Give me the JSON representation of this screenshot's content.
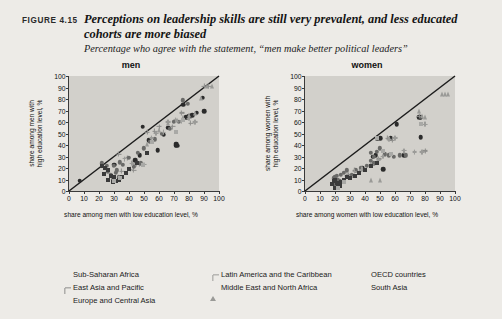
{
  "figure": {
    "number": "FIGURE 4.15",
    "title": "Perceptions on leadership skills are still very prevalent, and less educated cohorts are more biased",
    "subtitle": "Percentage who agree with the statement, “men make better political leaders”"
  },
  "legend": {
    "columns": [
      [
        {
          "label": "Sub-Saharan Africa",
          "marker": "circle",
          "color": "#2b2b2b",
          "size": 5.4
        },
        {
          "label": "East Asia and Pacific",
          "marker": "plus",
          "color": "#8d8d8a",
          "size": 6.4
        },
        {
          "label": "Europe and Central Asia",
          "marker": "circle",
          "color": "#6a6a68",
          "size": 5.4
        }
      ],
      [
        {
          "label": "Latin America and the Caribbean",
          "marker": "plus",
          "color": "#9b9b98",
          "size": 6.0
        },
        {
          "label": "Middle East and North Africa",
          "marker": "triangle",
          "color": "#9a9a97",
          "size": 5.6
        }
      ],
      [
        {
          "label": "OECD countries",
          "marker": "square",
          "color": "#3a3a3a",
          "size": 5.2
        },
        {
          "label": "South Asia",
          "marker": "square",
          "color": "#a9a9a6",
          "size": 5.2
        }
      ]
    ]
  },
  "chart_data": [
    {
      "type": "scatter",
      "title": "men",
      "xlabel": "share among men with low education level, %",
      "ylabel": "share among men with\nhigh education level, %",
      "xlim": [
        0,
        100
      ],
      "ylim": [
        0,
        100
      ],
      "xticks": [
        0,
        10,
        20,
        30,
        40,
        50,
        60,
        70,
        80,
        90,
        100
      ],
      "yticks": [
        0,
        10,
        20,
        30,
        40,
        50,
        60,
        70,
        80,
        90,
        100
      ],
      "grid": false,
      "reference_line": {
        "type": "45-degree",
        "from": [
          0,
          0
        ],
        "to": [
          100,
          100
        ]
      },
      "series": [
        {
          "name": "Sub-Saharan Africa",
          "marker": "circle",
          "color": "#2b2b2b",
          "size": 4.6,
          "points": [
            [
              7,
              9
            ],
            [
              30,
              23
            ],
            [
              44,
              27
            ],
            [
              49,
              56
            ],
            [
              59,
              35.5
            ],
            [
              63,
              49
            ],
            [
              71,
              40
            ],
            [
              71.5,
              41
            ],
            [
              72,
              39.5
            ],
            [
              76,
              75
            ],
            [
              78,
              64
            ],
            [
              80,
              65
            ],
            [
              82,
              66
            ],
            [
              85,
              68
            ],
            [
              90,
              69.5
            ],
            [
              89,
              81
            ],
            [
              47,
              31
            ],
            [
              53,
              44
            ],
            [
              66,
              55
            ]
          ]
        },
        {
          "name": "East Asia and Pacific",
          "marker": "plus",
          "color": "#8d8d8a",
          "size": 5.0,
          "points": [
            [
              33,
              32
            ],
            [
              39,
              29
            ],
            [
              44,
              23
            ],
            [
              47,
              23.5
            ],
            [
              52,
              51
            ],
            [
              57,
              52
            ],
            [
              60,
              56
            ],
            [
              69,
              56
            ],
            [
              75,
              68
            ],
            [
              81,
              59
            ],
            [
              90,
              91
            ],
            [
              93,
              91
            ],
            [
              43,
              18
            ],
            [
              35,
              17
            ]
          ]
        },
        {
          "name": "Europe and Central Asia",
          "marker": "circle",
          "color": "#6a6a68",
          "size": 4.4,
          "points": [
            [
              22,
              24
            ],
            [
              25,
              22
            ],
            [
              28,
              14
            ],
            [
              30,
              22
            ],
            [
              31,
              16
            ],
            [
              32,
              18
            ],
            [
              34,
              25
            ],
            [
              36,
              23
            ],
            [
              40,
              29
            ],
            [
              43,
              21
            ],
            [
              46,
              33
            ],
            [
              48,
              24
            ],
            [
              50,
              37
            ],
            [
              54,
              43
            ],
            [
              57,
              45
            ],
            [
              62,
              50
            ],
            [
              67,
              54
            ],
            [
              70,
              60
            ],
            [
              73,
              60
            ],
            [
              76,
              79
            ],
            [
              79,
              76
            ],
            [
              33,
              12
            ],
            [
              29,
              10
            ],
            [
              26,
              17
            ]
          ]
        },
        {
          "name": "Latin America and the Caribbean",
          "marker": "plus",
          "color": "#9b9b98",
          "size": 4.8,
          "points": [
            [
              37,
              28
            ],
            [
              42,
              24
            ],
            [
              45,
              23
            ],
            [
              50,
              23
            ],
            [
              55,
              46
            ],
            [
              58,
              50
            ],
            [
              63,
              51
            ],
            [
              66,
              60
            ],
            [
              71,
              62
            ],
            [
              75,
              61
            ],
            [
              80,
              63
            ],
            [
              84,
              60
            ],
            [
              41,
              19
            ]
          ]
        },
        {
          "name": "Middle East and North Africa",
          "marker": "triangle",
          "color": "#9a9a97",
          "size": 4.8,
          "points": [
            [
              60,
              53
            ],
            [
              66,
              59
            ],
            [
              72,
              62
            ],
            [
              76,
              64
            ],
            [
              80,
              66
            ],
            [
              84,
              68
            ],
            [
              88,
              81
            ],
            [
              92,
              91
            ],
            [
              95,
              91
            ],
            [
              52,
              41
            ]
          ]
        },
        {
          "name": "OECD countries",
          "marker": "square",
          "color": "#3a3a3a",
          "size": 4.0,
          "points": [
            [
              22,
              22
            ],
            [
              24,
              20
            ],
            [
              26,
              18
            ],
            [
              28,
              13
            ],
            [
              30,
              12
            ],
            [
              31,
              9
            ],
            [
              33,
              10
            ],
            [
              35,
              12
            ],
            [
              38,
              16
            ],
            [
              40,
              19
            ],
            [
              45,
              24
            ],
            [
              49,
              23
            ],
            [
              52,
              33
            ],
            [
              26,
              10
            ],
            [
              29,
              8
            ],
            [
              23,
              15
            ]
          ]
        },
        {
          "name": "South Asia",
          "marker": "square",
          "color": "#a9a9a6",
          "size": 4.0,
          "points": [
            [
              71,
              51
            ],
            [
              76,
              62
            ],
            [
              49,
              23
            ],
            [
              55,
              43
            ],
            [
              30,
              9
            ],
            [
              34,
              11
            ]
          ]
        }
      ]
    },
    {
      "type": "scatter",
      "title": "women",
      "xlabel": "share among women with low education level, %",
      "ylabel": "share among women with\nhigh education level, %",
      "xlim": [
        0,
        100
      ],
      "ylim": [
        0,
        100
      ],
      "xticks": [
        0,
        10,
        20,
        30,
        40,
        50,
        60,
        70,
        80,
        90,
        100
      ],
      "yticks": [
        0,
        10,
        20,
        30,
        40,
        50,
        60,
        70,
        80,
        90,
        100
      ],
      "grid": false,
      "reference_line": {
        "type": "45-degree",
        "from": [
          0,
          0
        ],
        "to": [
          100,
          100
        ]
      },
      "series": [
        {
          "name": "Sub-Saharan Africa",
          "marker": "circle",
          "color": "#2b2b2b",
          "size": 4.6,
          "points": [
            [
              48,
              46
            ],
            [
              50,
              46
            ],
            [
              52,
              19
            ],
            [
              57,
              46
            ],
            [
              61,
              58
            ],
            [
              76,
              64
            ],
            [
              77,
              64
            ],
            [
              77,
              47
            ],
            [
              45,
              30
            ],
            [
              47,
              31
            ],
            [
              38,
              20
            ],
            [
              66,
              31
            ]
          ]
        },
        {
          "name": "East Asia and Pacific",
          "marker": "plus",
          "color": "#8d8d8a",
          "size": 5.0,
          "points": [
            [
              33,
              18
            ],
            [
              36,
              17
            ],
            [
              29,
              14
            ],
            [
              55,
              46
            ],
            [
              58,
              44
            ],
            [
              76,
              65
            ],
            [
              80,
              35
            ],
            [
              49,
              28
            ],
            [
              31,
              12
            ]
          ]
        },
        {
          "name": "Europe and Central Asia",
          "marker": "circle",
          "color": "#6a6a68",
          "size": 4.4,
          "points": [
            [
              19,
              11
            ],
            [
              20,
              12
            ],
            [
              21,
              13
            ],
            [
              22,
              10
            ],
            [
              23,
              9
            ],
            [
              24,
              14
            ],
            [
              26,
              16
            ],
            [
              28,
              18
            ],
            [
              31,
              14
            ],
            [
              34,
              18
            ],
            [
              37,
              20
            ],
            [
              41,
              22
            ],
            [
              44,
              26
            ],
            [
              46,
              30
            ],
            [
              48,
              34
            ],
            [
              50,
              37
            ],
            [
              53,
              32
            ],
            [
              56,
              31
            ],
            [
              59,
              30
            ],
            [
              63,
              31
            ],
            [
              67,
              31
            ],
            [
              20,
              5
            ],
            [
              22,
              6
            ],
            [
              25,
              8
            ],
            [
              44,
              33
            ],
            [
              46,
              24
            ]
          ]
        },
        {
          "name": "Latin America and the Caribbean",
          "marker": "plus",
          "color": "#9b9b98",
          "size": 4.8,
          "points": [
            [
              28,
              13
            ],
            [
              33,
              17
            ],
            [
              38,
              19
            ],
            [
              44,
              23
            ],
            [
              49,
              27
            ],
            [
              52,
              30
            ],
            [
              56,
              45
            ],
            [
              60,
              46
            ],
            [
              66,
              35
            ],
            [
              73,
              34
            ],
            [
              78,
              34
            ],
            [
              80,
              58
            ]
          ]
        },
        {
          "name": "Middle East and North Africa",
          "marker": "triangle",
          "color": "#9a9a97",
          "size": 4.8,
          "points": [
            [
              50,
              10
            ],
            [
              76,
              70
            ],
            [
              78,
              65
            ],
            [
              80,
              64
            ],
            [
              91,
              84
            ],
            [
              95,
              84
            ],
            [
              93,
              84
            ],
            [
              44,
              10
            ]
          ]
        },
        {
          "name": "OECD countries",
          "marker": "square",
          "color": "#3a3a3a",
          "size": 4.0,
          "points": [
            [
              19,
              9
            ],
            [
              20,
              10
            ],
            [
              21,
              7
            ],
            [
              22,
              5
            ],
            [
              23,
              4
            ],
            [
              24,
              8
            ],
            [
              26,
              10
            ],
            [
              28,
              12
            ],
            [
              30,
              11
            ],
            [
              33,
              13
            ],
            [
              36,
              16
            ],
            [
              40,
              18
            ],
            [
              44,
              22
            ],
            [
              48,
              24
            ],
            [
              20,
              3
            ],
            [
              18,
              6
            ]
          ]
        },
        {
          "name": "South Asia",
          "marker": "square",
          "color": "#a9a9a6",
          "size": 4.0,
          "points": [
            [
              22,
              3
            ],
            [
              48,
              46
            ],
            [
              52,
              35
            ],
            [
              57,
              32
            ],
            [
              77,
              58
            ],
            [
              26,
              8
            ]
          ]
        }
      ]
    }
  ]
}
